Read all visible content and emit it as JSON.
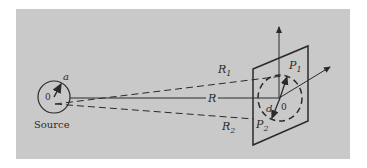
{
  "figure": {
    "background_color": "#c9c9c9",
    "line_color": "#2a2a2a",
    "source": {
      "caption": "Source",
      "origin_label": "0",
      "radius_label": "a"
    },
    "distances": {
      "center_label": "R",
      "upper_label": "R",
      "upper_subscript": "1",
      "lower_label": "R",
      "lower_subscript": "2"
    },
    "screen": {
      "origin_label": "0",
      "diameter_label": "d",
      "point1_label": "P",
      "point1_subscript": "1",
      "point2_label": "P",
      "point2_subscript": "2"
    }
  }
}
